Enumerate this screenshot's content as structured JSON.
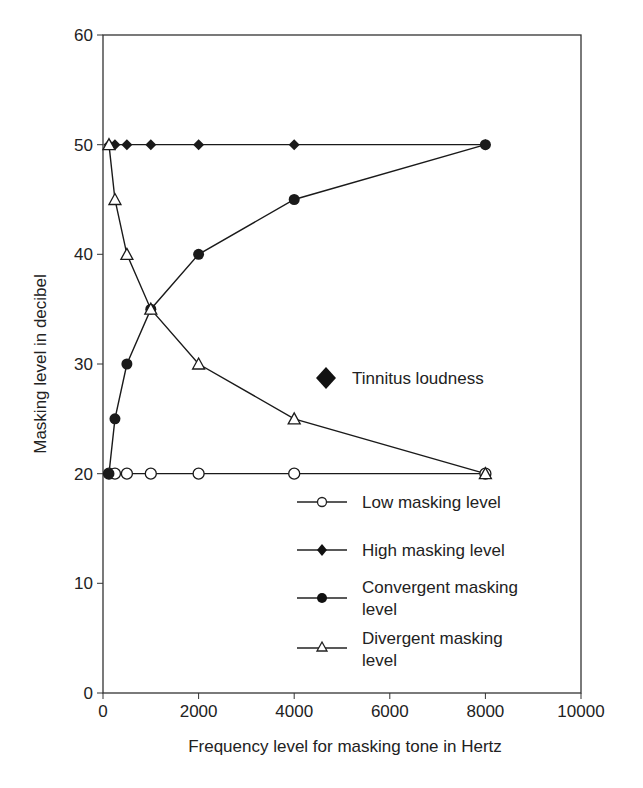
{
  "chart_data": {
    "type": "line",
    "title": "",
    "xlabel": "Frequency level for masking tone in Hertz",
    "ylabel": "Masking level  in decibel",
    "xlim": [
      0,
      10000
    ],
    "ylim": [
      0,
      60
    ],
    "xticks": [
      0,
      2000,
      4000,
      6000,
      8000,
      10000
    ],
    "yticks": [
      0,
      10,
      20,
      30,
      40,
      50,
      60
    ],
    "grid": false,
    "legend_position": "inside-right",
    "series": [
      {
        "name": "Low masking level",
        "marker": "open-circle",
        "x": [
          125,
          250,
          500,
          1000,
          2000,
          4000,
          8000
        ],
        "y": [
          20,
          20,
          20,
          20,
          20,
          20,
          20
        ]
      },
      {
        "name": "High masking level",
        "marker": "filled-diamond",
        "x": [
          125,
          250,
          500,
          1000,
          2000,
          4000,
          8000
        ],
        "y": [
          50,
          50,
          50,
          50,
          50,
          50,
          50
        ]
      },
      {
        "name": "Convergent masking level",
        "marker": "filled-circle",
        "x": [
          125,
          250,
          500,
          1000,
          2000,
          4000,
          8000
        ],
        "y": [
          20,
          25,
          30,
          35,
          40,
          45,
          50
        ]
      },
      {
        "name": "Divergent masking level",
        "marker": "open-triangle",
        "x": [
          125,
          250,
          500,
          1000,
          2000,
          4000,
          8000
        ],
        "y": [
          50,
          45,
          40,
          35,
          30,
          25,
          20
        ]
      }
    ],
    "annotations": [
      {
        "text": "Tinnitus loudness",
        "marker": "filled-diamond-large"
      }
    ]
  },
  "axes": {
    "xlabel": "Frequency level for masking tone in Hertz",
    "ylabel": "Masking level  in decibel",
    "xtick_labels": [
      "0",
      "2000",
      "4000",
      "6000",
      "8000",
      "10000"
    ],
    "ytick_labels": [
      "0",
      "10",
      "20",
      "30",
      "40",
      "50",
      "60"
    ]
  },
  "legend": {
    "tinnitus": "Tinnitus loudness",
    "low": "Low masking level",
    "high": "High masking level",
    "convergent_line1": "Convergent masking",
    "convergent_line2": "level",
    "divergent_line1": "Divergent masking",
    "divergent_line2": "level"
  },
  "colors": {
    "ink": "#1a1a1a",
    "background": "#ffffff"
  }
}
